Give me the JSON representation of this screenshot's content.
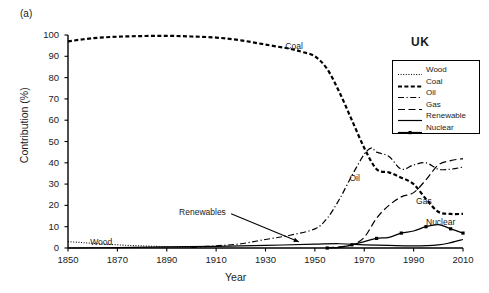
{
  "panel_label": "(a)",
  "chart_data": {
    "type": "line",
    "title": "UK",
    "xlabel": "Year",
    "ylabel": "Contribution (%)",
    "xlim": [
      1850,
      2010
    ],
    "ylim": [
      0,
      100
    ],
    "xticks": [
      1850,
      1870,
      1890,
      1910,
      1930,
      1950,
      1970,
      1990,
      2010
    ],
    "yticks": [
      0,
      10,
      20,
      30,
      40,
      50,
      60,
      70,
      80,
      90,
      100
    ],
    "grid": false,
    "legend_position": "top-right",
    "annotations": [
      {
        "text": "Coal",
        "x": 1938,
        "y": 95
      },
      {
        "text": "Oil",
        "x": 1964,
        "y": 33
      },
      {
        "text": "Gas",
        "x": 1991,
        "y": 22
      },
      {
        "text": "Nuclear",
        "x": 1995,
        "y": 12
      },
      {
        "text": "Wood",
        "x": 1859,
        "y": 3
      },
      {
        "text": "Renewables",
        "x": 1895,
        "y": 17,
        "arrow_to_x": 1937,
        "arrow_to_y": 2
      }
    ],
    "series": [
      {
        "name": "Wood",
        "style": "dotted",
        "x": [
          1850,
          1855,
          1860,
          1865,
          1870,
          1875,
          1880,
          1885,
          1890,
          1895,
          1900
        ],
        "values": [
          3.0,
          2.6,
          2.2,
          1.8,
          1.5,
          1.2,
          1.0,
          0.8,
          0.6,
          0.4,
          0.3
        ]
      },
      {
        "name": "Coal",
        "style": "dashed",
        "x": [
          1850,
          1860,
          1870,
          1880,
          1890,
          1900,
          1910,
          1920,
          1930,
          1940,
          1945,
          1950,
          1955,
          1960,
          1965,
          1970,
          1975,
          1980,
          1985,
          1990,
          1995,
          2000,
          2005,
          2010
        ],
        "values": [
          97.0,
          98.5,
          99.2,
          99.5,
          99.6,
          99.3,
          98.8,
          97.5,
          95.5,
          93.5,
          92.0,
          90.0,
          84.0,
          73.0,
          60.0,
          47.0,
          37.0,
          35.5,
          33.0,
          30.0,
          23.0,
          17.0,
          16.0,
          16.0
        ]
      },
      {
        "name": "Oil",
        "style": "dashdot",
        "x": [
          1900,
          1910,
          1920,
          1930,
          1940,
          1950,
          1955,
          1960,
          1965,
          1970,
          1973,
          1975,
          1980,
          1985,
          1990,
          1995,
          2000,
          2005,
          2010
        ],
        "values": [
          0.3,
          1.0,
          2.0,
          4.0,
          6.0,
          9.0,
          14.0,
          23.0,
          34.0,
          44.0,
          47.0,
          45.0,
          43.0,
          37.0,
          39.0,
          40.0,
          37.0,
          37.0,
          38.0
        ]
      },
      {
        "name": "Gas",
        "style": "longdash",
        "x": [
          1955,
          1960,
          1965,
          1970,
          1975,
          1980,
          1985,
          1990,
          1995,
          2000,
          2005,
          2010
        ],
        "values": [
          0.2,
          0.5,
          1.5,
          5.0,
          14.0,
          20.0,
          24.0,
          26.0,
          32.0,
          39.0,
          41.0,
          42.0
        ]
      },
      {
        "name": "Renewable",
        "style": "solid",
        "x": [
          1850,
          1870,
          1890,
          1910,
          1930,
          1950,
          1960,
          1970,
          1980,
          1990,
          2000,
          2005,
          2010
        ],
        "values": [
          0.0,
          0.2,
          0.5,
          0.8,
          1.2,
          1.8,
          2.0,
          1.5,
          1.2,
          1.0,
          1.5,
          2.5,
          4.0
        ]
      },
      {
        "name": "Nuclear",
        "style": "solid-marker",
        "x": [
          1955,
          1960,
          1965,
          1970,
          1975,
          1980,
          1985,
          1990,
          1995,
          2000,
          2005,
          2010
        ],
        "values": [
          0.0,
          0.3,
          1.5,
          3.0,
          4.5,
          5.0,
          7.0,
          8.0,
          10.0,
          11.0,
          9.0,
          7.0
        ]
      }
    ]
  },
  "legend": {
    "items": [
      {
        "label": "Wood",
        "style": "dotted"
      },
      {
        "label": "Coal",
        "style": "dashed"
      },
      {
        "label": "Oil",
        "style": "dashdot"
      },
      {
        "label": "Gas",
        "style": "longdash"
      },
      {
        "label": "Renewable",
        "style": "solid"
      },
      {
        "label": "Nuclear",
        "style": "solid-marker"
      }
    ]
  }
}
